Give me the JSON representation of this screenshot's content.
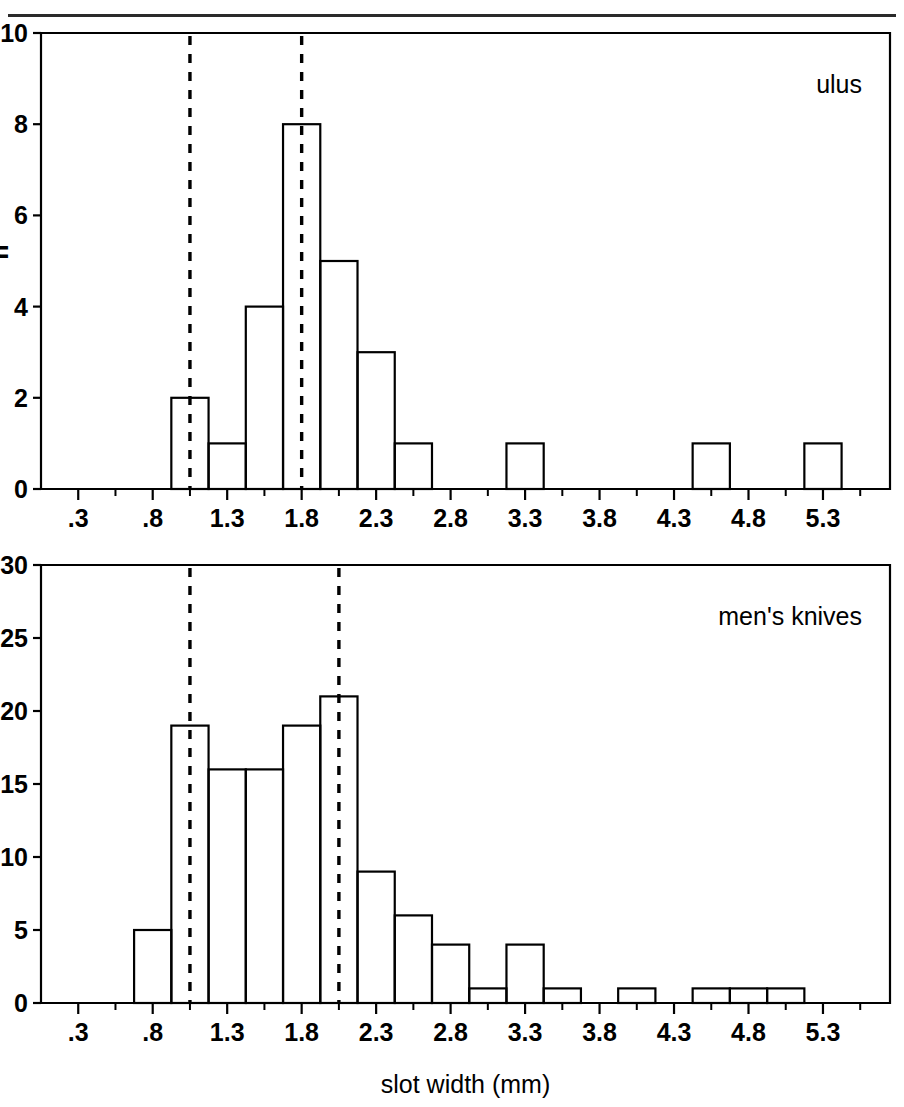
{
  "figure": {
    "width": 904,
    "height": 1107,
    "background": "#ffffff",
    "ink_color": "#000000",
    "rule_color": "#2a2a2a",
    "xlabel": "slot width (mm)"
  },
  "chart_data": [
    {
      "type": "bar",
      "subtype": "histogram",
      "title": "ulus",
      "panel": "top",
      "xlabel": "",
      "ylabel": "n",
      "ylabel_note": "partially cropped at left edge",
      "xlim": [
        0.05,
        5.75
      ],
      "ylim": [
        0,
        10
      ],
      "ytick_values": [
        0,
        2,
        4,
        6,
        8,
        10
      ],
      "ytick_labels": [
        "0",
        "2",
        "4",
        "6",
        "8",
        "10"
      ],
      "xtick_values": [
        0.3,
        0.8,
        1.3,
        1.8,
        2.3,
        2.8,
        3.3,
        3.8,
        4.3,
        4.8,
        5.3
      ],
      "xtick_labels": [
        ".3",
        ".8",
        "1.3",
        "1.8",
        "2.3",
        "2.8",
        "3.3",
        "3.8",
        "4.3",
        "4.8",
        "5.3"
      ],
      "minor_ticks": true,
      "grid": false,
      "legend": "none",
      "bin_width": 0.25,
      "bins": [
        {
          "x0": 0.925,
          "x1": 1.175,
          "value": 2
        },
        {
          "x0": 1.175,
          "x1": 1.425,
          "value": 1
        },
        {
          "x0": 1.425,
          "x1": 1.675,
          "value": 4
        },
        {
          "x0": 1.675,
          "x1": 1.925,
          "value": 8
        },
        {
          "x0": 1.925,
          "x1": 2.175,
          "value": 5
        },
        {
          "x0": 2.175,
          "x1": 2.425,
          "value": 3
        },
        {
          "x0": 2.425,
          "x1": 2.675,
          "value": 1
        },
        {
          "x0": 3.175,
          "x1": 3.425,
          "value": 1
        },
        {
          "x0": 4.425,
          "x1": 4.675,
          "value": 1
        },
        {
          "x0": 5.175,
          "x1": 5.425,
          "value": 1
        }
      ],
      "reference_lines": [
        {
          "x": 1.05,
          "style": "dashed"
        },
        {
          "x": 1.8,
          "style": "dashed"
        }
      ]
    },
    {
      "type": "bar",
      "subtype": "histogram",
      "title": "men's knives",
      "panel": "bottom",
      "xlabel": "slot width (mm)",
      "ylabel": "",
      "xlim": [
        0.05,
        5.75
      ],
      "ylim": [
        0,
        30
      ],
      "ytick_values": [
        0,
        5,
        10,
        15,
        20,
        25,
        30
      ],
      "ytick_labels": [
        "0",
        "5",
        "10",
        "15",
        "20",
        "25",
        "30"
      ],
      "xtick_values": [
        0.3,
        0.8,
        1.3,
        1.8,
        2.3,
        2.8,
        3.3,
        3.8,
        4.3,
        4.8,
        5.3
      ],
      "xtick_labels": [
        ".3",
        ".8",
        "1.3",
        "1.8",
        "2.3",
        "2.8",
        "3.3",
        "3.8",
        "4.3",
        "4.8",
        "5.3"
      ],
      "minor_ticks": true,
      "grid": false,
      "legend": "none",
      "bin_width": 0.25,
      "bins": [
        {
          "x0": 0.675,
          "x1": 0.925,
          "value": 5
        },
        {
          "x0": 0.925,
          "x1": 1.175,
          "value": 19
        },
        {
          "x0": 1.175,
          "x1": 1.425,
          "value": 16
        },
        {
          "x0": 1.425,
          "x1": 1.675,
          "value": 16
        },
        {
          "x0": 1.675,
          "x1": 1.925,
          "value": 19
        },
        {
          "x0": 1.925,
          "x1": 2.175,
          "value": 21
        },
        {
          "x0": 2.175,
          "x1": 2.425,
          "value": 9
        },
        {
          "x0": 2.425,
          "x1": 2.675,
          "value": 6
        },
        {
          "x0": 2.675,
          "x1": 2.925,
          "value": 4
        },
        {
          "x0": 2.925,
          "x1": 3.175,
          "value": 1
        },
        {
          "x0": 3.175,
          "x1": 3.425,
          "value": 4
        },
        {
          "x0": 3.425,
          "x1": 3.675,
          "value": 1
        },
        {
          "x0": 3.925,
          "x1": 4.175,
          "value": 1
        },
        {
          "x0": 4.425,
          "x1": 4.675,
          "value": 1
        },
        {
          "x0": 4.675,
          "x1": 4.925,
          "value": 1
        },
        {
          "x0": 4.925,
          "x1": 5.175,
          "value": 1
        }
      ],
      "reference_lines": [
        {
          "x": 1.05,
          "style": "dashed"
        },
        {
          "x": 2.05,
          "style": "dashed"
        }
      ]
    }
  ]
}
